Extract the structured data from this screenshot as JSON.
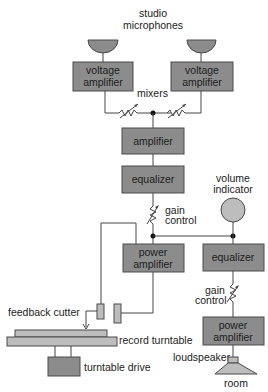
{
  "diagram": {
    "labels": {
      "studio_microphones_1": "studio",
      "studio_microphones_2": "microphones",
      "mixers": "mixers",
      "gain_control_1_a": "gain",
      "gain_control_1_b": "control",
      "volume_indicator_a": "volume",
      "volume_indicator_b": "indicator",
      "feedback_cutter": "feedback cutter",
      "record_turntable": "record turntable",
      "turntable_drive": "turntable drive",
      "gain_control_2_a": "gain",
      "gain_control_2_b": "control",
      "loudspeaker": "loudspeaker",
      "room": "room"
    },
    "blocks": {
      "voltage_amp_left_a": "voltage",
      "voltage_amp_left_b": "amplifier",
      "voltage_amp_right_a": "voltage",
      "voltage_amp_right_b": "amplifier",
      "amplifier": "amplifier",
      "equalizer_main": "equalizer",
      "power_amp_main_a": "power",
      "power_amp_main_b": "amplifier",
      "equalizer_monitor": "equalizer",
      "power_amp_monitor_a": "power",
      "power_amp_monitor_b": "amplifier"
    },
    "colors": {
      "block_fill": "#8c8c8c",
      "light_fill": "#bdbdbd",
      "line": "#444444"
    }
  }
}
